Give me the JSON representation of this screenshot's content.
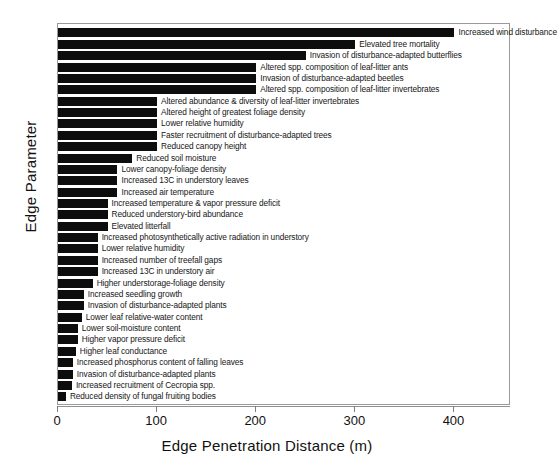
{
  "chart_data": {
    "type": "bar",
    "orientation": "horizontal",
    "title": "",
    "xlabel": "Edge Penetration Distance (m)",
    "ylabel": "Edge Parameter",
    "xlim": [
      0,
      457
    ],
    "xticks": [
      0,
      100,
      200,
      300,
      400
    ],
    "xticklabels": [
      "0",
      "100",
      "200",
      "300",
      "400"
    ],
    "grid": false,
    "legend": null,
    "bar_color": "#0d0d0d",
    "frame_color": "#9a9a9a",
    "categories": [
      "Increased wind disturbance",
      "Elevated tree mortality",
      "Invasion of disturbance-adapted butterflies",
      "Altered spp. composition of leaf-litter ants",
      "Invasion of disturbance-adapted beetles",
      "Altered spp. composition of leaf-litter invertebrates",
      "Altered abundance & diversity of leaf-litter invertebrates",
      "Altered height of greatest foliage density",
      "Lower relative humidity",
      "Faster recruitment of disturbance-adapted trees",
      "Reduced canopy height",
      "Reduced soil moisture",
      "Lower canopy-foliage density",
      "Increased 13C in understory leaves",
      "Increased air temperature",
      "Increased temperature & vapor pressure deficit",
      "Reduced understory-bird abundance",
      "Elevated litterfall",
      "Increased photosynthetically active radiation in understory",
      "Lower relative humidity",
      "Increased number of treefall gaps",
      "Increased 13C in understory air",
      "Higher understorage-foliage density",
      "Increased seedling growth",
      "Invasion of disturbance-adapted plants",
      "Lower leaf relative-water content",
      "Lower soil-moisture content",
      "Higher vapor pressure deficit",
      "Higher leaf conductance",
      "Increased phosphorus content of falling leaves",
      "Invasion of disturbance-adapted plants",
      "Increased recruitment of Cecropia spp.",
      "Reduced density of fungal fruiting bodies"
    ],
    "values": [
      400,
      300,
      250,
      200,
      200,
      200,
      100,
      100,
      100,
      100,
      100,
      75,
      60,
      60,
      60,
      50,
      50,
      50,
      40,
      40,
      40,
      40,
      35,
      26,
      26,
      24,
      20,
      20,
      18,
      15,
      15,
      14,
      8
    ]
  }
}
